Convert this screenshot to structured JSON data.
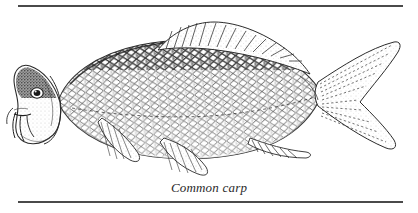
{
  "figure": {
    "caption": "Common carp",
    "style": "stipple-engraving-line-art",
    "background_color": "#ffffff",
    "ink_color": "#2b2b2b"
  },
  "rules": {
    "top_label": "top-horizontal-rule",
    "bottom_label": "bottom-horizontal-rule",
    "color": "#4a4a4a"
  },
  "anatomy": {
    "head": "head",
    "eye": "eye",
    "mouth": "mouth",
    "barbels": "barbels",
    "operculum": "gill-cover",
    "body": "scaled-body",
    "dorsal_fin": "dorsal-fin",
    "caudal_fin": "caudal-fin",
    "pectoral_fin": "pectoral-fin",
    "pelvic_fin": "pelvic-fin",
    "anal_fin": "anal-fin",
    "lateral_line": "lateral-line"
  }
}
